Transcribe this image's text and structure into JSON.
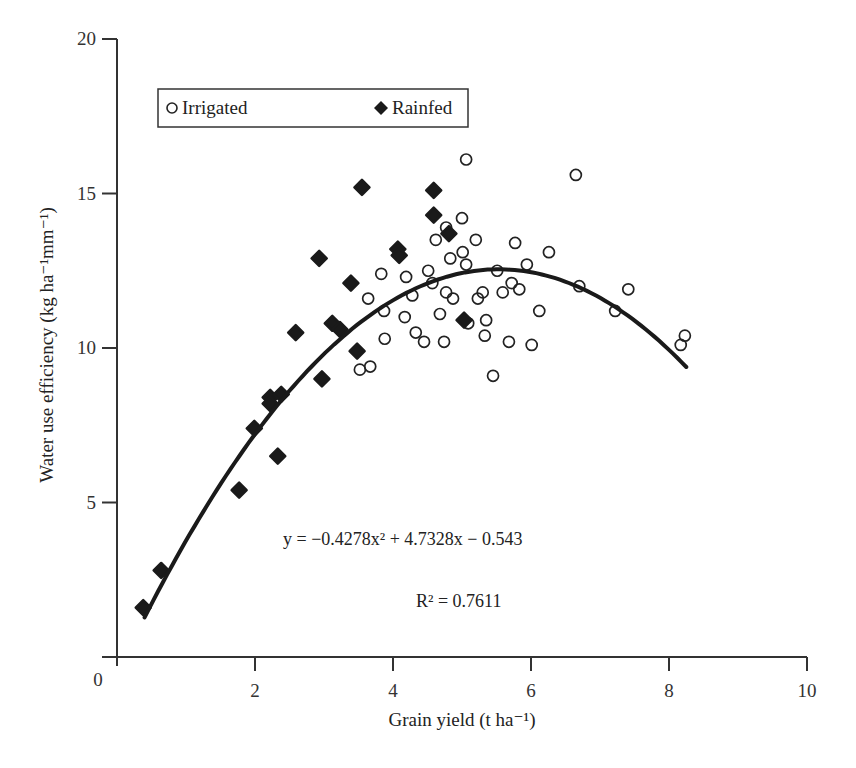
{
  "chart_data": {
    "type": "scatter",
    "title": "",
    "xlabel": "Grain yield (t ha⁻¹)",
    "ylabel": "Water use efficiency (kg ha⁻¹mm⁻¹)",
    "xlim": [
      0,
      10
    ],
    "ylim": [
      0,
      20
    ],
    "x_ticks": [
      0,
      2,
      4,
      6,
      8,
      10
    ],
    "y_ticks": [
      0,
      5,
      10,
      15,
      20
    ],
    "grid": false,
    "legend_position": "upper-left (boxed)",
    "series": [
      {
        "name": "Irrigated",
        "marker": "open-circle",
        "points": [
          [
            3.52,
            9.3
          ],
          [
            3.67,
            9.4
          ],
          [
            3.64,
            11.6
          ],
          [
            3.83,
            12.4
          ],
          [
            3.87,
            11.2
          ],
          [
            3.88,
            10.3
          ],
          [
            4.17,
            11.0
          ],
          [
            4.19,
            12.3
          ],
          [
            4.28,
            11.7
          ],
          [
            4.33,
            10.5
          ],
          [
            4.45,
            10.2
          ],
          [
            4.51,
            12.5
          ],
          [
            4.57,
            12.1
          ],
          [
            4.62,
            13.5
          ],
          [
            4.68,
            11.1
          ],
          [
            4.74,
            10.2
          ],
          [
            4.77,
            13.9
          ],
          [
            4.77,
            11.8
          ],
          [
            4.83,
            12.9
          ],
          [
            4.87,
            11.6
          ],
          [
            5.0,
            14.2
          ],
          [
            5.01,
            13.1
          ],
          [
            5.06,
            16.1
          ],
          [
            5.06,
            12.7
          ],
          [
            5.09,
            10.8
          ],
          [
            5.2,
            13.5
          ],
          [
            5.23,
            11.6
          ],
          [
            5.3,
            11.8
          ],
          [
            5.33,
            10.4
          ],
          [
            5.35,
            10.9
          ],
          [
            5.45,
            9.1
          ],
          [
            5.51,
            12.5
          ],
          [
            5.59,
            11.8
          ],
          [
            5.68,
            10.2
          ],
          [
            5.72,
            12.1
          ],
          [
            5.77,
            13.4
          ],
          [
            5.83,
            11.9
          ],
          [
            5.94,
            12.7
          ],
          [
            6.01,
            10.1
          ],
          [
            6.12,
            11.2
          ],
          [
            6.26,
            13.1
          ],
          [
            6.65,
            15.6
          ],
          [
            6.7,
            12.0
          ],
          [
            7.22,
            11.2
          ],
          [
            7.41,
            11.9
          ],
          [
            8.17,
            10.1
          ],
          [
            8.23,
            10.4
          ]
        ]
      },
      {
        "name": "Rainfed",
        "marker": "filled-diamond",
        "points": [
          [
            0.38,
            1.6
          ],
          [
            0.64,
            2.8
          ],
          [
            1.77,
            5.4
          ],
          [
            1.99,
            7.4
          ],
          [
            2.22,
            8.4
          ],
          [
            2.22,
            8.2
          ],
          [
            2.38,
            8.5
          ],
          [
            2.33,
            6.5
          ],
          [
            2.59,
            10.5
          ],
          [
            2.97,
            9.0
          ],
          [
            2.93,
            12.9
          ],
          [
            3.12,
            10.8
          ],
          [
            3.23,
            10.6
          ],
          [
            3.39,
            12.1
          ],
          [
            3.48,
            9.9
          ],
          [
            3.55,
            15.2
          ],
          [
            4.07,
            13.2
          ],
          [
            4.09,
            13.0
          ],
          [
            4.59,
            15.1
          ],
          [
            4.59,
            14.3
          ],
          [
            4.81,
            13.7
          ],
          [
            5.03,
            10.9
          ]
        ]
      }
    ],
    "trendline": {
      "type": "polynomial-2",
      "a": -0.4278,
      "b": 4.7328,
      "c": -0.543,
      "x_range": [
        0.4,
        8.25
      ],
      "equation_label": "y = −0.4278x² + 4.7328x − 0.543",
      "r2_label": "R² = 0.7611"
    }
  },
  "legend": {
    "irrigated_label": "Irrigated",
    "rainfed_label": "Rainfed"
  },
  "axes": {
    "x_title": "Grain yield (t ha⁻¹)",
    "y_title": "Water use efficiency (kg ha⁻¹mm⁻¹)",
    "x_tick_labels": [
      "0",
      "2",
      "4",
      "6",
      "8",
      "10"
    ],
    "y_tick_labels": [
      "5",
      "10",
      "15",
      "20"
    ]
  },
  "annotations": {
    "equation": "y = −0.4278x² + 4.7328x − 0.543",
    "r_squared": "R² = 0.7611"
  },
  "colors": {
    "ink": "#1a1a1a",
    "axis": "#333333",
    "background": "#ffffff"
  }
}
